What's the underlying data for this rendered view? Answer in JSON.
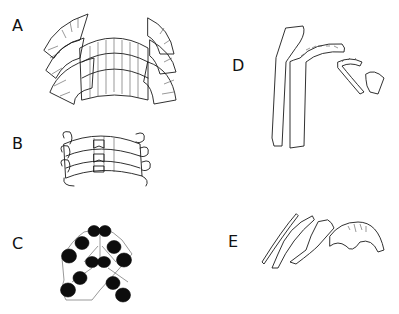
{
  "figure": {
    "panels": [
      {
        "id": "A",
        "label": "A",
        "description": "radula row with fan-shaped marginal teeth flanking rows of central/lateral teeth"
      },
      {
        "id": "B",
        "label": "B",
        "description": "three rows of radular teeth with hooked marginals"
      },
      {
        "id": "C",
        "label": "C",
        "description": "paired teeth with solid black cusps in chevron arrangement"
      },
      {
        "id": "D",
        "label": "D",
        "description": "isolated elongate tooth elements with serrated cusps"
      },
      {
        "id": "E",
        "label": "E",
        "description": "isolated curved teeth and a bilobed central tooth"
      }
    ]
  }
}
